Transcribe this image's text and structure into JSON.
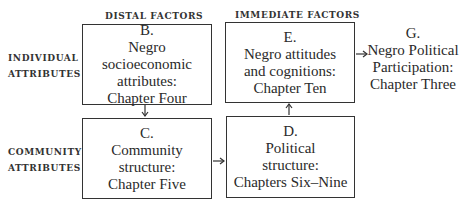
{
  "columns": {
    "distal": "DISTAL FACTORS",
    "immediate": "IMMEDIATE FACTORS"
  },
  "rows": {
    "individual": [
      "INDIVIDUAL",
      "ATTRIBUTES"
    ],
    "community": [
      "COMMUNITY",
      "ATTRIBUTES"
    ]
  },
  "nodes": {
    "B": {
      "letter": "B.",
      "lines": [
        "Negro socioeconomic",
        "attributes:",
        "Chapter Four"
      ]
    },
    "C": {
      "letter": "C.",
      "lines": [
        "Community",
        "structure:",
        "Chapter Five"
      ]
    },
    "D": {
      "letter": "D.",
      "lines": [
        "Political",
        "structure:",
        "Chapters Six–Nine"
      ]
    },
    "E": {
      "letter": "E.",
      "lines": [
        "Negro attitudes",
        "and cognitions:",
        "Chapter Ten"
      ]
    },
    "G": {
      "letter": "G.",
      "lines": [
        "Negro Political",
        "Participation:",
        "Chapter Three"
      ]
    }
  },
  "edges": [
    {
      "from": "B",
      "to": "C"
    },
    {
      "from": "C",
      "to": "D"
    },
    {
      "from": "D",
      "to": "E"
    },
    {
      "from": "E",
      "to": "G"
    }
  ]
}
